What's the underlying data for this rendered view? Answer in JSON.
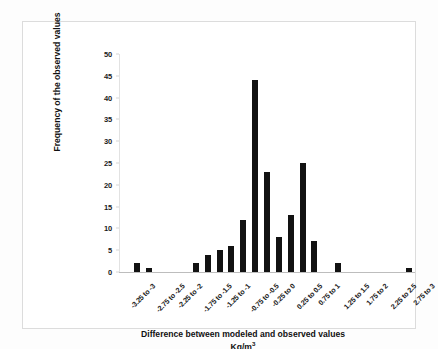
{
  "chart_data": {
    "type": "bar",
    "title": "",
    "subtitle": "",
    "xlabel": "Difference between modeled and observed values",
    "xlabel_units": "Kg/m",
    "xlabel_units_exponent": "3",
    "ylabel": "Frequency of the observed values",
    "ylim": [
      0,
      50
    ],
    "ytick_step": 5,
    "ytick_labels": [
      "0",
      "5",
      "10",
      "15",
      "20",
      "25",
      "30",
      "35",
      "40",
      "45",
      "50"
    ],
    "ytick_values": [
      0,
      5,
      10,
      15,
      20,
      25,
      30,
      35,
      40,
      45,
      50
    ],
    "grid": false,
    "legend": null,
    "bar_color": "#121212",
    "categories": [
      "-3.25 to -3",
      "-2.75 to -2.5",
      "-2.25 to -2",
      "-1.75 to -1.5",
      "-1.25 to -1",
      "-0.75 to -0.5",
      "-0.25 to 0",
      "0.25 to 0.5",
      "0.75 to 1",
      "1.25 to 1.5",
      "1.75 to 2",
      "2.25 to 2.5",
      "2.75 to 3"
    ],
    "bins": [
      {
        "label": "-3.25 to -3",
        "labeled": true,
        "value": 0
      },
      {
        "label": "-3 to -2.75",
        "labeled": false,
        "value": 2
      },
      {
        "label": "-2.75 to -2.5",
        "labeled": true,
        "value": 1
      },
      {
        "label": "-2.5 to -2.25",
        "labeled": false,
        "value": 0
      },
      {
        "label": "-2.25 to -2",
        "labeled": true,
        "value": 0
      },
      {
        "label": "-2 to -1.75",
        "labeled": false,
        "value": 0
      },
      {
        "label": "-1.75 to -1.5",
        "labeled": true,
        "value": 2
      },
      {
        "label": "-1.5 to -1.25",
        "labeled": false,
        "value": 4
      },
      {
        "label": "-1.25 to -1",
        "labeled": true,
        "value": 5
      },
      {
        "label": "-1 to -0.75",
        "labeled": false,
        "value": 6
      },
      {
        "label": "-0.75 to -0.5",
        "labeled": true,
        "value": 12
      },
      {
        "label": "-0.5 to -0.25",
        "labeled": false,
        "value": 44
      },
      {
        "label": "-0.25 to 0",
        "labeled": true,
        "value": 23
      },
      {
        "label": "0 to 0.25",
        "labeled": false,
        "value": 8
      },
      {
        "label": "0.25 to 0.5",
        "labeled": true,
        "value": 13
      },
      {
        "label": "0.5 to 0.75",
        "labeled": false,
        "value": 25
      },
      {
        "label": "0.75 to 1",
        "labeled": true,
        "value": 7
      },
      {
        "label": "1 to 1.25",
        "labeled": false,
        "value": 0
      },
      {
        "label": "1.25 to 1.5",
        "labeled": true,
        "value": 2
      },
      {
        "label": "1.5 to 1.75",
        "labeled": false,
        "value": 0
      },
      {
        "label": "1.75 to 2",
        "labeled": true,
        "value": 0
      },
      {
        "label": "2 to 2.25",
        "labeled": false,
        "value": 0
      },
      {
        "label": "2.25 to 2.5",
        "labeled": true,
        "value": 0
      },
      {
        "label": "2.5 to 2.75",
        "labeled": false,
        "value": 0
      },
      {
        "label": "2.75 to 3",
        "labeled": true,
        "value": 1
      }
    ]
  }
}
